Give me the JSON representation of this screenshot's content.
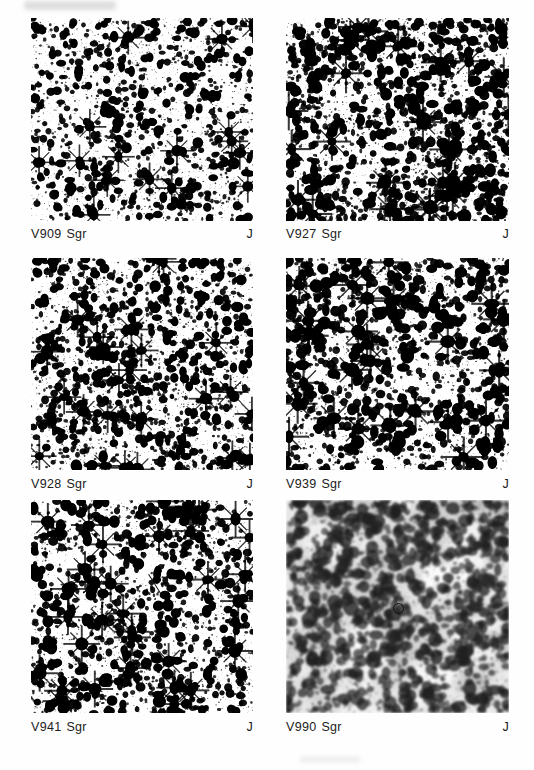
{
  "figure": {
    "type": "photographic-finding-chart-plate",
    "band_note": "J",
    "columns": 2,
    "rows": 3,
    "panel_count": 6
  },
  "panels": [
    {
      "id": "panel-v909-sgr",
      "star_name": "V909",
      "constellation": "Sgr",
      "band": "J",
      "x": 31,
      "y": 18,
      "w": 222,
      "h": 203,
      "caption_y": 226,
      "density": 0.46,
      "contrast": 0.8,
      "blob_scale": 1.0,
      "seed": 10909,
      "tone": "light",
      "markers": []
    },
    {
      "id": "panel-v927-sgr",
      "star_name": "V927",
      "constellation": "Sgr",
      "band": "J",
      "x": 286,
      "y": 18,
      "w": 223,
      "h": 203,
      "caption_y": 226,
      "density": 0.62,
      "contrast": 0.88,
      "blob_scale": 1.18,
      "seed": 20927,
      "tone": "light",
      "markers": []
    },
    {
      "id": "panel-v928-sgr",
      "star_name": "V928",
      "constellation": "Sgr",
      "band": "J",
      "x": 31,
      "y": 258,
      "w": 222,
      "h": 212,
      "caption_y": 476,
      "density": 0.58,
      "contrast": 0.86,
      "blob_scale": 1.05,
      "seed": 30928,
      "tone": "light",
      "markers": []
    },
    {
      "id": "panel-v939-sgr",
      "star_name": "V939",
      "constellation": "Sgr",
      "band": "J",
      "x": 286,
      "y": 258,
      "w": 223,
      "h": 212,
      "caption_y": 476,
      "density": 0.52,
      "contrast": 0.84,
      "blob_scale": 1.22,
      "seed": 40939,
      "tone": "light",
      "markers": []
    },
    {
      "id": "panel-v941-sgr",
      "star_name": "V941",
      "constellation": "Sgr",
      "band": "J",
      "x": 31,
      "y": 500,
      "w": 222,
      "h": 213,
      "caption_y": 719,
      "density": 0.5,
      "contrast": 0.84,
      "blob_scale": 1.1,
      "seed": 50941,
      "tone": "light",
      "markers": [
        {
          "kind": "tick",
          "x": 118,
          "y": 74,
          "length": 26,
          "angle": 58,
          "thickness": 1.4
        }
      ]
    },
    {
      "id": "panel-v990-sgr",
      "star_name": "V990",
      "constellation": "Sgr",
      "band": "J",
      "x": 286,
      "y": 500,
      "w": 223,
      "h": 213,
      "caption_y": 719,
      "density": 0.6,
      "contrast": 0.42,
      "blob_scale": 1.35,
      "seed": 60990,
      "tone": "grainy-dark",
      "markers": [
        {
          "kind": "circle",
          "x": 112,
          "y": 108,
          "diameter": 11
        }
      ]
    }
  ]
}
